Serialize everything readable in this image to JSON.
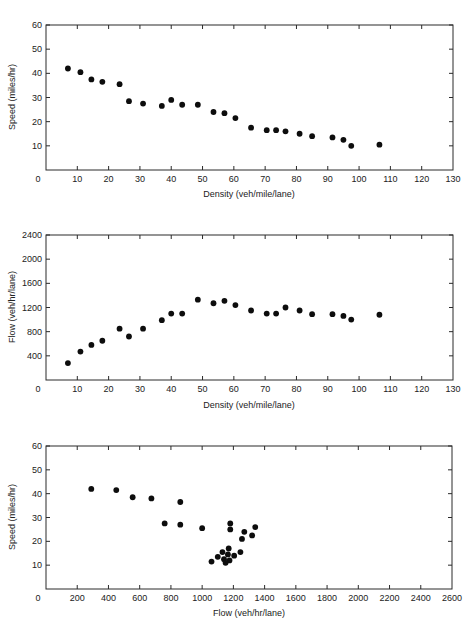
{
  "chart_data": [
    {
      "type": "scatter",
      "title": "",
      "xlabel": "Density (veh/mile/lane)",
      "ylabel": "Speed (miles/hr)",
      "xlim": [
        0,
        130
      ],
      "ylim": [
        0,
        60
      ],
      "xticks": [
        0,
        10,
        20,
        30,
        40,
        50,
        60,
        70,
        80,
        90,
        100,
        110,
        120,
        130
      ],
      "yticks": [
        10,
        20,
        30,
        40,
        50,
        60
      ],
      "grid": false,
      "x": [
        7,
        11,
        14.5,
        18,
        23.5,
        26.5,
        31,
        37,
        40,
        43.5,
        48.5,
        53.5,
        57,
        60.5,
        65.5,
        70.5,
        73.5,
        76.5,
        81,
        85,
        91.5,
        95,
        97.5,
        106.5
      ],
      "y": [
        42,
        40.5,
        37.5,
        36.5,
        35.5,
        28.5,
        27.5,
        26.5,
        29,
        27,
        27,
        24,
        23.5,
        21.5,
        17.5,
        16.5,
        16.5,
        16,
        15,
        14,
        13.5,
        12.5,
        10,
        10.5
      ]
    },
    {
      "type": "scatter",
      "title": "",
      "xlabel": "Density (veh/mile/lane)",
      "ylabel": "Flow (veh/hr/lane)",
      "xlim": [
        0,
        130
      ],
      "ylim": [
        0,
        2400
      ],
      "xticks": [
        0,
        10,
        20,
        30,
        40,
        50,
        60,
        70,
        80,
        90,
        100,
        110,
        120,
        130
      ],
      "yticks": [
        400,
        800,
        1200,
        1600,
        2000,
        2400
      ],
      "grid": false,
      "x": [
        7,
        11,
        14.5,
        18,
        23.5,
        26.5,
        31,
        37,
        40,
        43.5,
        48.5,
        53.5,
        57,
        60.5,
        65.5,
        70.5,
        73.5,
        76.5,
        81,
        85,
        91.5,
        95,
        97.5,
        106.5
      ],
      "y": [
        280,
        470,
        580,
        650,
        850,
        720,
        850,
        990,
        1100,
        1100,
        1330,
        1270,
        1310,
        1240,
        1150,
        1100,
        1100,
        1200,
        1150,
        1090,
        1090,
        1060,
        1000,
        1080
      ]
    },
    {
      "type": "scatter",
      "title": "",
      "xlabel": "Flow (veh/hr/lane)",
      "ylabel": "Speed (miles/hr)",
      "xlim": [
        0,
        2600
      ],
      "ylim": [
        0,
        60
      ],
      "xticks": [
        0,
        200,
        400,
        600,
        800,
        1000,
        1200,
        1400,
        1600,
        1800,
        2000,
        2200,
        2400,
        2600
      ],
      "yticks": [
        10,
        20,
        30,
        40,
        50,
        60
      ],
      "grid": false,
      "x": [
        290,
        450,
        555,
        675,
        760,
        860,
        860,
        1000,
        1180,
        1180,
        1270,
        1340,
        1255,
        1320,
        1170,
        1130,
        1100,
        1165,
        1205,
        1245,
        1060,
        1140,
        1175,
        1150
      ],
      "y": [
        42,
        41.5,
        38.5,
        38,
        27.5,
        36.5,
        27,
        25.5,
        27.5,
        25,
        24,
        26,
        21,
        22.5,
        17,
        15.5,
        13.5,
        14.5,
        14,
        15.5,
        11.5,
        12.5,
        12,
        11
      ]
    }
  ],
  "charts": [
    {
      "ylabel": "Speed (miles/hr)",
      "xlabel": "Density (veh/mile/lane)",
      "ytick_labels": [
        "60",
        "50",
        "40",
        "30",
        "20",
        "10"
      ],
      "xtick_labels": [
        "0",
        "10",
        "20",
        "30",
        "40",
        "50",
        "60",
        "70",
        "80",
        "90",
        "100",
        "110",
        "120",
        "130"
      ]
    },
    {
      "ylabel": "Flow (veh/hr/lane)",
      "xlabel": "Density (veh/mile/lane)",
      "ytick_labels": [
        "2400",
        "2000",
        "1600",
        "1200",
        "800",
        "400"
      ],
      "xtick_labels": [
        "0",
        "10",
        "20",
        "30",
        "40",
        "50",
        "60",
        "70",
        "80",
        "90",
        "100",
        "110",
        "120",
        "130"
      ]
    },
    {
      "ylabel": "Speed (miles/hr)",
      "xlabel": "Flow (veh/hr/lane)",
      "ytick_labels": [
        "60",
        "50",
        "40",
        "30",
        "20",
        "10"
      ],
      "xtick_labels": [
        "0",
        "200",
        "400",
        "600",
        "800",
        "1000",
        "1200",
        "1400",
        "1600",
        "1800",
        "2000",
        "2200",
        "2400",
        "2600"
      ]
    }
  ],
  "colors": {
    "marker": "#0d0d0d",
    "axis": "#2a2a2a",
    "background": "#ffffff"
  }
}
